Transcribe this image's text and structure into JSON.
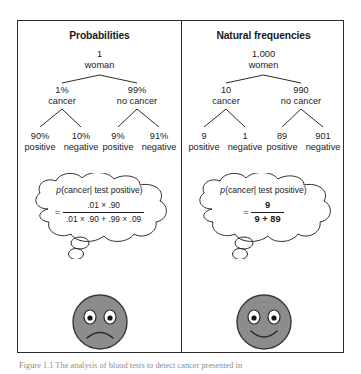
{
  "figure": {
    "caption": "Figure 1.1  The analysis of blood tests to detect cancer presented in"
  },
  "panels": [
    {
      "id": "probabilities",
      "title": "Probabilities",
      "root": {
        "value": "1",
        "label": "woman"
      },
      "level2": [
        {
          "value": "1%",
          "label": "cancer"
        },
        {
          "value": "99%",
          "label": "no cancer"
        }
      ],
      "leaves": [
        {
          "value": "90%",
          "label": "positive"
        },
        {
          "value": "10%",
          "label": "negative"
        },
        {
          "value": "9%",
          "label": "positive"
        },
        {
          "value": "91%",
          "label": "negative"
        }
      ],
      "bubble": {
        "title_p": "p",
        "title_rest": "(cancer| test positive)",
        "equals": "=",
        "numerator": ".01 × .90",
        "denominator": ".01 × .90 + .99 × .09",
        "frac_style": "wide"
      },
      "face": {
        "mood": "sad",
        "name": "sad-face"
      }
    },
    {
      "id": "frequencies",
      "title": "Natural frequencies",
      "root": {
        "value": "1,000",
        "label": "women"
      },
      "level2": [
        {
          "value": "10",
          "label": "cancer"
        },
        {
          "value": "990",
          "label": "no cancer"
        }
      ],
      "leaves": [
        {
          "value": "9",
          "label": "positive"
        },
        {
          "value": "1",
          "label": "negative"
        },
        {
          "value": "89",
          "label": "positive"
        },
        {
          "value": "901",
          "label": "negative"
        }
      ],
      "bubble": {
        "title_p": "p",
        "title_rest": "(cancer| test positive)",
        "equals": "=",
        "numerator": "9",
        "denominator": "9 + 89",
        "frac_style": "narrow"
      },
      "face": {
        "mood": "happy",
        "name": "happy-face"
      }
    }
  ],
  "colors": {
    "frame": "#2b2b2b",
    "text": "#1a1a1a",
    "face_fill": "#8c8c8c",
    "face_stroke": "#3a3a3a",
    "caption": "#8d8d8d"
  }
}
